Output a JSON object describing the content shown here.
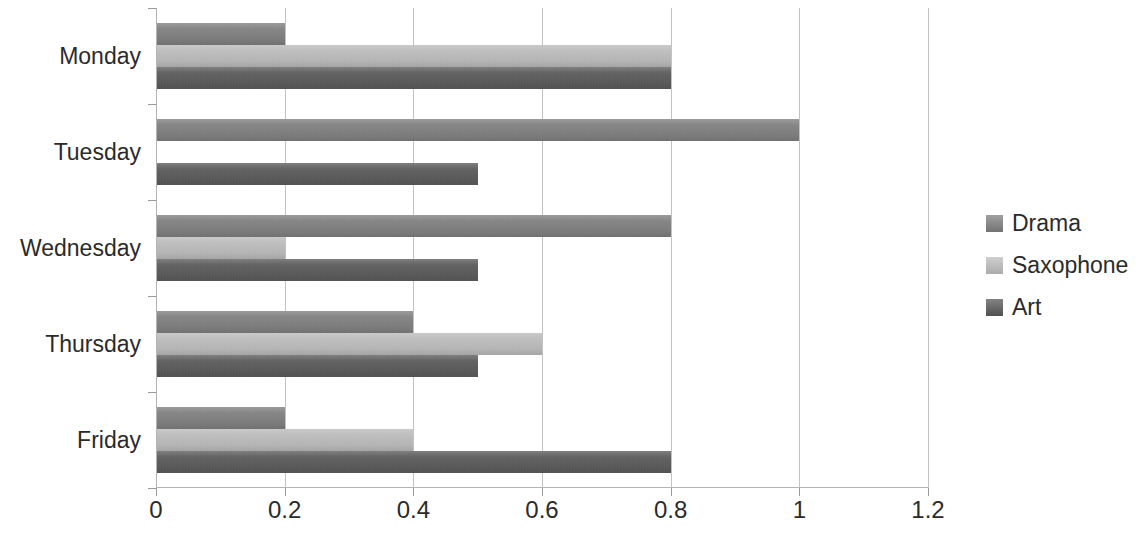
{
  "chart_data": {
    "type": "bar",
    "orientation": "horizontal",
    "title": "",
    "xlabel": "",
    "ylabel": "",
    "categories": [
      "Monday",
      "Tuesday",
      "Wednesday",
      "Thursday",
      "Friday"
    ],
    "series": [
      {
        "name": "Drama",
        "color": "#808080",
        "values": [
          0.2,
          1.0,
          0.8,
          0.4,
          0.2
        ]
      },
      {
        "name": "Saxophone",
        "color": "#bfbfbf",
        "values": [
          0.8,
          0.0,
          0.2,
          0.6,
          0.4
        ]
      },
      {
        "name": "Art",
        "color": "#595959",
        "values": [
          0.8,
          0.5,
          0.5,
          0.5,
          0.8
        ]
      }
    ],
    "xlim": [
      0,
      1.2
    ],
    "xticks": [
      0,
      0.2,
      0.4,
      0.6,
      0.8,
      1,
      1.2
    ],
    "xtick_labels": [
      "0",
      "0.2",
      "0.4",
      "0.6",
      "0.8",
      "1",
      "1.2"
    ],
    "grid": true,
    "grid_axis": "x",
    "legend_position": "right",
    "legend_entries": [
      "Drama",
      "Saxophone",
      "Art"
    ],
    "axis_color": "#b3b3b3",
    "gridline_color": "#c2c2c2",
    "text_color": "#2b2b2b",
    "background_color": "#ffffff"
  }
}
